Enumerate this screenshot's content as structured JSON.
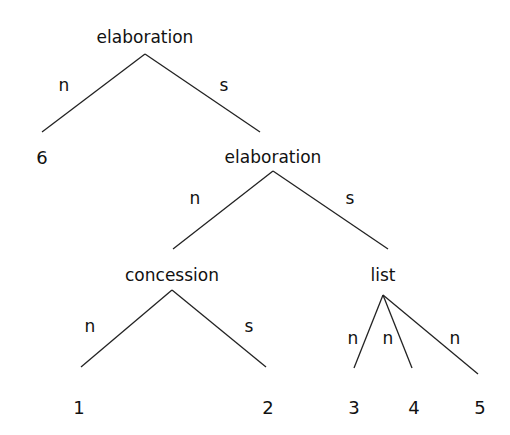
{
  "tree": {
    "root": {
      "label": "elaboration"
    },
    "leaf6": {
      "label": "6"
    },
    "elab2": {
      "label": "elaboration"
    },
    "concession": {
      "label": "concession"
    },
    "list": {
      "label": "list"
    },
    "leaves": [
      {
        "label": "1"
      },
      {
        "label": "2"
      },
      {
        "label": "3"
      },
      {
        "label": "4"
      },
      {
        "label": "5"
      }
    ],
    "edges": {
      "root_left": "n",
      "root_right": "s",
      "elab2_left": "n",
      "elab2_right": "s",
      "concession_left": "n",
      "concession_right": "s",
      "list_1": "n",
      "list_2": "n",
      "list_3": "n"
    }
  },
  "colors": {
    "line": "#222222",
    "text": "#111111",
    "background": "#ffffff"
  }
}
